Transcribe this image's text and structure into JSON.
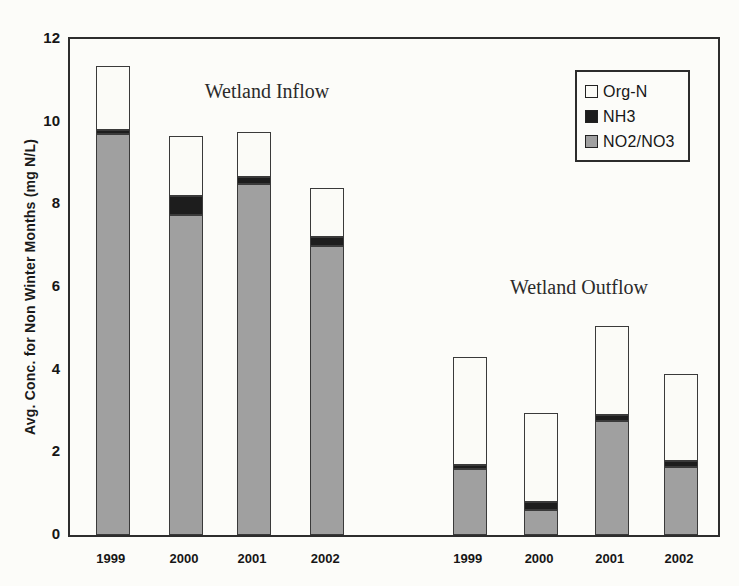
{
  "chart_data": {
    "type": "bar",
    "subtype": "stacked-vertical",
    "title": "",
    "xlabel": "",
    "ylabel": "Avg. Conc. for Non Winter Months (mg N/L)",
    "ylim": [
      0,
      12
    ],
    "yticks": [
      0,
      2,
      4,
      6,
      8,
      10,
      12
    ],
    "grid": false,
    "group_labels": [
      "Wetland Inflow",
      "Wetland Outflow"
    ],
    "categories": [
      "1999",
      "2000",
      "2001",
      "2002",
      "1999",
      "2000",
      "2001",
      "2002"
    ],
    "series": [
      {
        "name": "NO2/NO3",
        "color": "#a0a0a0",
        "values": [
          9.7,
          7.75,
          8.5,
          7.0,
          1.6,
          0.6,
          2.75,
          1.65
        ]
      },
      {
        "name": "NH3",
        "color": "#1d1d1d",
        "values": [
          0.1,
          0.45,
          0.15,
          0.2,
          0.1,
          0.2,
          0.15,
          0.15
        ]
      },
      {
        "name": "Org-N",
        "color": "#fbfbf7",
        "values": [
          1.55,
          1.45,
          1.1,
          1.2,
          2.6,
          2.15,
          2.15,
          2.1
        ]
      }
    ],
    "totals": [
      11.35,
      9.65,
      9.75,
      8.4,
      4.3,
      2.95,
      5.05,
      3.9
    ],
    "legend": {
      "position": "top-right",
      "entries": [
        "Org-N",
        "NH3",
        "NO2/NO3"
      ]
    },
    "layout": {
      "bar_centers_pct": [
        6.6,
        17.9,
        28.4,
        39.7,
        61.7,
        72.7,
        83.6,
        94.3
      ],
      "bar_width_px": 34,
      "inflow_label_pos": {
        "x": 197,
        "y": 52
      },
      "outflow_label_pos": {
        "x": 509,
        "y": 248
      }
    }
  }
}
